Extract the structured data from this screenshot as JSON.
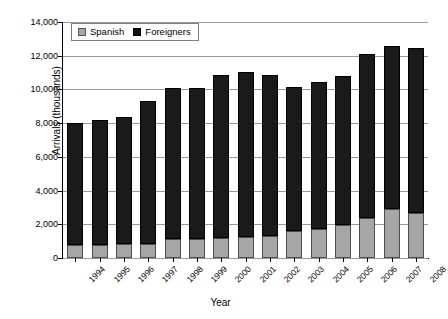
{
  "chart_data": {
    "type": "bar",
    "stacked": true,
    "title": "",
    "xlabel": "Year",
    "ylabel": "Arrivals (thousands)",
    "categories": [
      "1994",
      "1995",
      "1996",
      "1997",
      "1998",
      "1999",
      "2000",
      "2001",
      "2002",
      "2003",
      "2004",
      "2005",
      "2006",
      "2007",
      "2008"
    ],
    "series": [
      {
        "name": "Spanish",
        "color": "#a6a6a6",
        "values": [
          800,
          800,
          850,
          850,
          1100,
          1150,
          1200,
          1250,
          1300,
          1600,
          1700,
          1950,
          2350,
          2900,
          2650
        ]
      },
      {
        "name": "Foreigners",
        "color": "#1a1a1a",
        "values": [
          7200,
          7400,
          7500,
          8450,
          9000,
          8950,
          9650,
          9800,
          9550,
          8550,
          8750,
          8850,
          9750,
          9650,
          9800
        ]
      }
    ],
    "totals": [
      8000,
      8200,
      8350,
      9300,
      10100,
      10100,
      10850,
      11050,
      10850,
      10150,
      10450,
      10800,
      12100,
      12550,
      12450
    ],
    "ylim": [
      0,
      14000
    ],
    "yticks": [
      0,
      2000,
      4000,
      6000,
      8000,
      10000,
      12000,
      14000
    ],
    "ytick_labels": [
      "0",
      "2,000",
      "4,000",
      "6,000",
      "8,000",
      "10,000",
      "12,000",
      "14,000"
    ],
    "grid": true,
    "legend_position": "top-left",
    "legend_entries": [
      "Spanish",
      "Foreigners"
    ]
  }
}
